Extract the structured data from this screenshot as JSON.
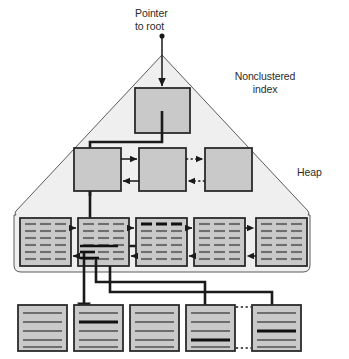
{
  "figure": {
    "background_color": "#ffffff"
  },
  "labels": {
    "pointer_to_root": "Pointer\nto root",
    "nonclustered_index": "Nonclustered\nindex",
    "heap": "Heap"
  },
  "colors": {
    "page_fill": "#c9c9c9",
    "page_stroke": "#2b2b2b",
    "region_fill": "#efefef",
    "region_stroke": "#4a4a4a",
    "line_color": "#1a1a1a",
    "row_line": "#6e6e6e",
    "row_line_bold": "#111111",
    "text_color": "#2b2b2b"
  },
  "structure": {
    "index_region": {
      "name": "nonclustered-index-triangle",
      "apex": [
        162,
        55
      ],
      "base_left": [
        14,
        215
      ],
      "base_right": [
        310,
        215
      ],
      "bottom": 272
    },
    "root_level": {
      "count": 1,
      "nodes": [
        {
          "id": "root-node",
          "x": 135,
          "y": 88,
          "w": 55,
          "h": 45
        }
      ]
    },
    "intermediate_level": {
      "count": 3,
      "nodes": [
        {
          "id": "intermediate-node-1",
          "x": 74,
          "y": 148,
          "w": 47,
          "h": 43
        },
        {
          "id": "intermediate-node-2",
          "x": 139,
          "y": 148,
          "w": 47,
          "h": 43
        },
        {
          "id": "intermediate-node-3",
          "x": 205,
          "y": 148,
          "w": 47,
          "h": 43
        }
      ],
      "links": [
        {
          "from": 1,
          "to": 2,
          "style": "solid",
          "direction": "both"
        },
        {
          "from": 2,
          "to": 3,
          "style": "dotted",
          "direction": "both"
        }
      ]
    },
    "leaf_level": {
      "count": 5,
      "rows_per_page": 6,
      "columns_per_page": 3,
      "nodes": [
        {
          "id": "leaf-page-1",
          "x": 20,
          "y": 218,
          "w": 51,
          "h": 48,
          "highlight_row": null
        },
        {
          "id": "leaf-page-2",
          "x": 78,
          "y": 218,
          "w": 51,
          "h": 48,
          "highlight_row": null
        },
        {
          "id": "leaf-page-3",
          "x": 136,
          "y": 218,
          "w": 51,
          "h": 48,
          "highlight_row": 0
        },
        {
          "id": "leaf-page-4",
          "x": 194,
          "y": 218,
          "w": 51,
          "h": 48,
          "highlight_row": null
        },
        {
          "id": "leaf-page-5",
          "x": 256,
          "y": 218,
          "w": 51,
          "h": 48,
          "highlight_row": null
        }
      ],
      "links": [
        {
          "from": 1,
          "to": 2,
          "style": "solid",
          "direction": "both"
        },
        {
          "from": 2,
          "to": 3,
          "style": "solid",
          "direction": "both"
        },
        {
          "from": 3,
          "to": 4,
          "style": "solid",
          "direction": "both"
        },
        {
          "from": 4,
          "to": 5,
          "style": "dotted",
          "direction": "both"
        }
      ]
    },
    "heap_level": {
      "count": 5,
      "rows_per_page": 5,
      "nodes": [
        {
          "id": "heap-page-1",
          "x": 18,
          "y": 305,
          "w": 49,
          "h": 46,
          "highlight_row": null
        },
        {
          "id": "heap-page-2",
          "x": 74,
          "y": 305,
          "w": 49,
          "h": 46,
          "highlight_row": 1
        },
        {
          "id": "heap-page-3",
          "x": 130,
          "y": 305,
          "w": 49,
          "h": 46,
          "highlight_row": null
        },
        {
          "id": "heap-page-4",
          "x": 186,
          "y": 305,
          "w": 49,
          "h": 46,
          "highlight_row": 3
        },
        {
          "id": "heap-page-5",
          "x": 252,
          "y": 305,
          "w": 49,
          "h": 46,
          "highlight_row": 2
        }
      ],
      "links": [
        {
          "from": 4,
          "to": 5,
          "style": "dotted",
          "direction": "none"
        }
      ]
    },
    "traversal_path": {
      "description": "Pointer to root enters root node, descends to intermediate level, then to leaf pages, then row pointers into heap pages.",
      "segments": [
        "pointer-to-root-arrow",
        "root-to-intermediate",
        "intermediate-to-leaf",
        "leaf-to-heap-page-2",
        "leaf-to-heap-page-4",
        "leaf-to-heap-page-5"
      ]
    }
  }
}
